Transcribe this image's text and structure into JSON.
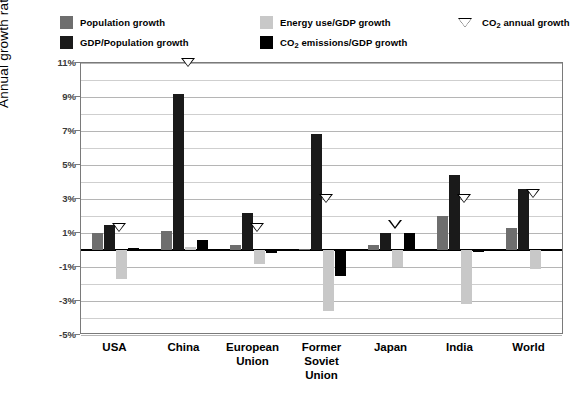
{
  "legend": {
    "entries": [
      {
        "key": "pop",
        "label": "Population growth",
        "color": "#6e6e6e",
        "type": "swatch"
      },
      {
        "key": "gdp",
        "label": "GDP/Population growth",
        "color": "#1a1a1a",
        "type": "swatch"
      },
      {
        "key": "ene",
        "label": "Energy use/GDP growth",
        "color": "#c8c8c8",
        "type": "swatch"
      },
      {
        "key": "co2gdp",
        "label_pre": "CO",
        "label_sub": "2",
        "label_post": " emissions/GDP growth",
        "color": "#000000",
        "type": "swatch"
      },
      {
        "key": "co2ann",
        "label_pre": "CO",
        "label_sub": "2",
        "label_post": " annual growth",
        "color": "#000000",
        "type": "marker"
      }
    ]
  },
  "axes": {
    "ylabel": "Annual growth rate",
    "yticks": [
      "11%",
      "9%",
      "7%",
      "5%",
      "3%",
      "1%",
      "-1%",
      "-3%",
      "-5%"
    ],
    "ylim": [
      -5,
      11
    ],
    "ystep": 2,
    "minor_step": 1,
    "grid": true,
    "zero_line": true
  },
  "chart_data": {
    "type": "bar",
    "title": "",
    "xlabel": "",
    "ylabel": "Annual growth rate",
    "ylim": [
      -5,
      11
    ],
    "grid": true,
    "legend_position": "top",
    "categories": [
      "USA",
      "China",
      "European\nUnion",
      "Former\nSoviet\nUnion",
      "Japan",
      "India",
      "World"
    ],
    "category_labels": [
      [
        "USA"
      ],
      [
        "China"
      ],
      [
        "European",
        "Union"
      ],
      [
        "Former",
        "Soviet",
        "Union"
      ],
      [
        "Japan"
      ],
      [
        "India"
      ],
      [
        "World"
      ]
    ],
    "series": [
      {
        "name": "Population growth",
        "key": "pop",
        "color": "#6e6e6e",
        "values": [
          1.0,
          1.1,
          0.3,
          0.05,
          0.3,
          2.0,
          1.3
        ]
      },
      {
        "name": "GDP/Population growth",
        "key": "gdp",
        "color": "#1a1a1a",
        "values": [
          1.5,
          9.2,
          2.2,
          6.8,
          1.0,
          4.4,
          3.6
        ]
      },
      {
        "name": "Energy use/GDP growth",
        "key": "ene",
        "color": "#c8c8c8",
        "values": [
          -1.7,
          0.2,
          -0.8,
          -3.6,
          -1.0,
          -3.2,
          -1.1
        ]
      },
      {
        "name": "CO2 emissions/GDP growth",
        "key": "co2",
        "color": "#000000",
        "values": [
          0.1,
          0.6,
          -0.15,
          -1.5,
          1.0,
          -0.1,
          0.05
        ]
      }
    ],
    "markers": {
      "name": "CO2 annual growth",
      "symbol": "down-triangle",
      "values": [
        1.3,
        11.0,
        1.3,
        3.0,
        1.5,
        3.0,
        3.3
      ]
    }
  }
}
